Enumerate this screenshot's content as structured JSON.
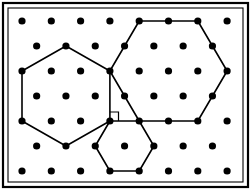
{
  "figure": {
    "canvas": {
      "width": 251,
      "height": 190
    },
    "background_color": "#ffffff",
    "stroke_color": "#000000",
    "dot_color": "#000000"
  },
  "frame": {
    "outer": {
      "x": 3,
      "y": 3,
      "width": 245,
      "height": 184,
      "stroke_width": 2.2
    },
    "inner": {
      "x": 8,
      "y": 8,
      "width": 235,
      "height": 174,
      "stroke_width": 1.1
    },
    "label": "rectangular border frame"
  },
  "lattice": {
    "description": "triangular (staggered) dot lattice, 7 rows",
    "dot_radius": 3.6,
    "row_spacing": 25,
    "col_spacing": 29.3,
    "stagger_offset": 14.65,
    "rows": [
      {
        "index": 0,
        "y": 21,
        "count": 7,
        "x": [
          22,
          51.3,
          80.6,
          109.9,
          139.2,
          168.5,
          197.8,
          227.1
        ]
      },
      {
        "index": 1,
        "y": 46,
        "count": 7,
        "x": [
          36.65,
          65.95,
          95.25,
          124.55,
          153.85,
          183.15,
          212.45
        ]
      },
      {
        "index": 2,
        "y": 71,
        "count": 8,
        "x": [
          22,
          51.3,
          80.6,
          109.9,
          139.2,
          168.5,
          197.8,
          227.1
        ]
      },
      {
        "index": 3,
        "y": 96,
        "count": 7,
        "x": [
          36.65,
          65.95,
          95.25,
          124.55,
          153.85,
          183.15,
          212.45
        ]
      },
      {
        "index": 4,
        "y": 121,
        "count": 8,
        "x": [
          22,
          51.3,
          80.6,
          109.9,
          139.2,
          168.5,
          197.8,
          227.1
        ]
      },
      {
        "index": 5,
        "y": 146,
        "count": 7,
        "x": [
          36.65,
          65.95,
          95.25,
          124.55,
          153.85,
          183.15,
          212.45
        ]
      },
      {
        "index": 6,
        "y": 171,
        "count": 8,
        "x": [
          22,
          51.3,
          80.6,
          109.9,
          139.2,
          168.5,
          197.8,
          227.1
        ]
      }
    ]
  },
  "shapes": {
    "hexagon_left": {
      "label": "left hexagon",
      "stroke_width": 1.6,
      "points": "65.95,46 109.9,71 109.9,121 65.95,146 22,121 22,71"
    },
    "hexagon_right": {
      "label": "right hexagon",
      "stroke_width": 1.6,
      "points": "139.2,21 197.8,21 227.1,71 197.8,121 139.2,121 109.9,71"
    },
    "hexagon_small": {
      "label": "small lower hexagon",
      "stroke_width": 1.6,
      "points": "109.9,121 139.2,121 153.85,146 139.2,171 109.9,171 95.25,146"
    },
    "right_angle_marker": {
      "label": "right angle marker at shared vertex",
      "stroke_width": 1.2,
      "points": "109.9,112 118.5,112 118.5,121"
    }
  },
  "annotations": {
    "shared_vertex": {
      "x": 109.9,
      "y": 121,
      "label": "shared-vertex"
    },
    "apex_vertex": {
      "x": 109.9,
      "y": 71,
      "label": "apex-vertex"
    }
  }
}
